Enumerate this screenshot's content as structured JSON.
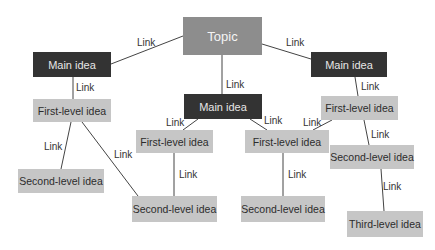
{
  "diagram": {
    "type": "concept-map",
    "colors": {
      "topic_bg": "#8d8d8d",
      "topic_text": "#f4f4f4",
      "main_bg": "#333333",
      "main_text": "#e6e6e6",
      "level_bg": "#c6c6c6",
      "level_text": "#2c2c2c",
      "line": "#444444"
    },
    "nodes": [
      {
        "id": "topic",
        "label": "Topic",
        "kind": "topic",
        "x": 183,
        "y": 17,
        "w": 79,
        "h": 38
      },
      {
        "id": "main-left",
        "label": "Main idea",
        "kind": "main",
        "x": 33,
        "y": 52,
        "w": 78,
        "h": 25
      },
      {
        "id": "main-center",
        "label": "Main idea",
        "kind": "main",
        "x": 184,
        "y": 94,
        "w": 78,
        "h": 25
      },
      {
        "id": "main-right",
        "label": "Main idea",
        "kind": "main",
        "x": 311,
        "y": 52,
        "w": 76,
        "h": 25
      },
      {
        "id": "first-left",
        "label": "First-level idea",
        "kind": "level",
        "x": 33,
        "y": 99,
        "w": 78,
        "h": 23
      },
      {
        "id": "first-center-left",
        "label": "First-level idea",
        "kind": "level",
        "x": 136,
        "y": 130,
        "w": 77,
        "h": 23
      },
      {
        "id": "first-center-right",
        "label": "First-level idea",
        "kind": "level",
        "x": 245,
        "y": 130,
        "w": 84,
        "h": 23
      },
      {
        "id": "first-right",
        "label": "First-level idea",
        "kind": "level",
        "x": 321,
        "y": 96,
        "w": 77,
        "h": 24
      },
      {
        "id": "second-left",
        "label": "Second-level idea",
        "kind": "level",
        "x": 18,
        "y": 169,
        "w": 86,
        "h": 24
      },
      {
        "id": "second-center-left",
        "label": "Second-level idea",
        "kind": "level",
        "x": 132,
        "y": 196,
        "w": 85,
        "h": 26
      },
      {
        "id": "second-center-right",
        "label": "Second-level idea",
        "kind": "level",
        "x": 241,
        "y": 196,
        "w": 84,
        "h": 26
      },
      {
        "id": "second-right",
        "label": "Second-level idea",
        "kind": "level",
        "x": 330,
        "y": 145,
        "w": 84,
        "h": 24
      },
      {
        "id": "third-right",
        "label": "Third-level idea",
        "kind": "level",
        "x": 347,
        "y": 211,
        "w": 76,
        "h": 26
      }
    ],
    "links": [
      {
        "from": "topic",
        "to": "main-left",
        "label": "Link",
        "x1": 183,
        "y1": 36,
        "x2": 111,
        "y2": 64,
        "lx": 137,
        "ly": 38
      },
      {
        "from": "topic",
        "to": "main-center",
        "label": "Link",
        "x1": 222,
        "y1": 55,
        "x2": 222,
        "y2": 94,
        "lx": 226,
        "ly": 80
      },
      {
        "from": "topic",
        "to": "main-right",
        "label": "Link",
        "x1": 262,
        "y1": 44,
        "x2": 311,
        "y2": 59,
        "lx": 286,
        "ly": 38
      },
      {
        "from": "main-left",
        "to": "first-left",
        "label": "Link",
        "x1": 73,
        "y1": 77,
        "x2": 73,
        "y2": 99,
        "lx": 76,
        "ly": 83
      },
      {
        "from": "first-left",
        "to": "second-left",
        "label": "Link",
        "x1": 71,
        "y1": 122,
        "x2": 61,
        "y2": 169,
        "lx": 44,
        "ly": 142
      },
      {
        "from": "first-left",
        "to": "second-center-left",
        "label": "Link",
        "x1": 82,
        "y1": 122,
        "x2": 138,
        "y2": 196,
        "lx": 114,
        "ly": 150
      },
      {
        "from": "main-center",
        "to": "first-center-left",
        "label": "Link",
        "x1": 198,
        "y1": 119,
        "x2": 183,
        "y2": 130,
        "lx": 166,
        "ly": 118
      },
      {
        "from": "main-center",
        "to": "first-center-right",
        "label": "Link",
        "x1": 250,
        "y1": 119,
        "x2": 267,
        "y2": 130,
        "lx": 264,
        "ly": 116
      },
      {
        "from": "first-right",
        "to": "first-center-right",
        "label": "Link",
        "x1": 332,
        "y1": 120,
        "x2": 313,
        "y2": 130,
        "lx": 303,
        "ly": 118
      },
      {
        "from": "main-right",
        "to": "first-right",
        "label": "Link",
        "x1": 355,
        "y1": 77,
        "x2": 358,
        "y2": 96,
        "lx": 361,
        "ly": 82
      },
      {
        "from": "first-center-left",
        "to": "second-center-left",
        "label": "Link",
        "x1": 174,
        "y1": 153,
        "x2": 174,
        "y2": 196,
        "lx": 179,
        "ly": 170
      },
      {
        "from": "first-center-right",
        "to": "second-center-right",
        "label": "Link",
        "x1": 283,
        "y1": 153,
        "x2": 283,
        "y2": 196,
        "lx": 288,
        "ly": 170
      },
      {
        "from": "first-right",
        "to": "second-right",
        "label": "Link",
        "x1": 364,
        "y1": 120,
        "x2": 369,
        "y2": 145,
        "lx": 371,
        "ly": 130
      },
      {
        "from": "second-right",
        "to": "third-right",
        "label": "Link",
        "x1": 381,
        "y1": 169,
        "x2": 384,
        "y2": 211,
        "lx": 383,
        "ly": 182
      }
    ]
  }
}
